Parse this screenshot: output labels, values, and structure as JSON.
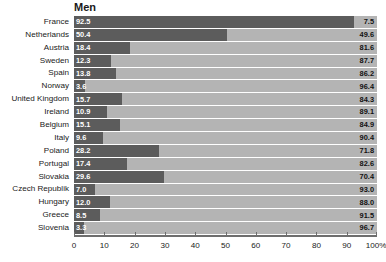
{
  "chart_title": "Men",
  "chart_data": {
    "type": "bar",
    "subtype": "stacked-horizontal-100",
    "title": "Men",
    "xlabel": "",
    "ylabel": "",
    "xlim": [
      0,
      100
    ],
    "grid": false,
    "legend": "none",
    "axis_unit": "%",
    "categories": [
      "France",
      "Netherlands",
      "Austria",
      "Sweden",
      "Spain",
      "Norway",
      "United Kingdom",
      "Ireland",
      "Belgium",
      "Italy",
      "Poland",
      "Portugal",
      "Slovakia",
      "Czech Republik",
      "Hungary",
      "Greece",
      "Slovenia"
    ],
    "series": [
      {
        "name": "left-segment",
        "color": "#5c5c5c",
        "values": [
          92.5,
          50.4,
          18.4,
          12.3,
          13.8,
          3.6,
          15.7,
          10.9,
          15.1,
          9.6,
          28.2,
          17.4,
          29.6,
          7.0,
          12.0,
          8.5,
          3.3
        ]
      },
      {
        "name": "right-segment",
        "color": "#b4b4b4",
        "values": [
          7.5,
          49.6,
          81.6,
          87.7,
          86.2,
          96.4,
          84.3,
          89.1,
          84.9,
          90.4,
          71.8,
          82.6,
          70.4,
          93.0,
          88.0,
          91.5,
          96.7
        ]
      }
    ],
    "left_labels": [
      "92.5",
      "50.4",
      "18.4",
      "12.3",
      "13.8",
      "3.6",
      "15.7",
      "10.9",
      "15.1",
      "9.6",
      "28.2",
      "17.4",
      "29.6",
      "7.0",
      "12.0",
      "8.5",
      "3.3"
    ],
    "right_labels": [
      "7.5",
      "49.6",
      "81.6",
      "87.7",
      "86.2",
      "96.4",
      "84.3",
      "89.1",
      "84.9",
      "90.4",
      "71.8",
      "82.6",
      "70.4",
      "93.0",
      "88.0",
      "91.5",
      "96.7"
    ],
    "xticks": [
      0,
      10,
      20,
      30,
      40,
      50,
      60,
      70,
      80,
      90,
      100
    ],
    "xticklabels": [
      "0",
      "10",
      "20",
      "30",
      "40",
      "50",
      "60",
      "70",
      "80",
      "90",
      "100%"
    ]
  },
  "colors": {
    "dark_segment": "#5c5c5c",
    "light_segment": "#b4b4b4",
    "axis": "#6e6e6e",
    "text": "#1a1a1a",
    "value_light_text": "#ffffff",
    "background": "#ffffff"
  }
}
